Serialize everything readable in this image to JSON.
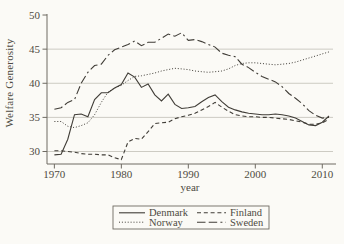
{
  "figure": {
    "background": "#fbfaf6",
    "line_color": "#403d37",
    "grid_color": "#c7c5bd",
    "axis_color": "#6e6a62",
    "text_color": "#4e4a42"
  },
  "chart_data": {
    "type": "line",
    "title": "",
    "ylabel": "Welfare Generosity",
    "xlabel": "year",
    "xlim": [
      1968.9,
      2011.6
    ],
    "ylim": [
      28.17,
      50.15
    ],
    "x_ticks": [
      1970,
      1980,
      1990,
      2000,
      2010
    ],
    "y_ticks": [
      30,
      35,
      40,
      45,
      50
    ],
    "grid_y": [
      30,
      35,
      40,
      45
    ],
    "grid": true,
    "legend_position": "bottom",
    "x": [
      1970,
      1971,
      1972,
      1973,
      1974,
      1975,
      1976,
      1977,
      1978,
      1979,
      1980,
      1981,
      1982,
      1983,
      1984,
      1985,
      1986,
      1987,
      1988,
      1989,
      1990,
      1991,
      1992,
      1993,
      1994,
      1995,
      1996,
      1997,
      1998,
      1999,
      2000,
      2001,
      2002,
      2003,
      2004,
      2005,
      2006,
      2007,
      2008,
      2009,
      2010,
      2011
    ],
    "series": [
      {
        "name": "Denmark",
        "line_style": "solid",
        "values": [
          29.5,
          29.6,
          31.8,
          35.4,
          35.5,
          35.1,
          37.6,
          38.6,
          38.6,
          39.3,
          39.8,
          41.5,
          40.9,
          39.4,
          39.9,
          38.3,
          37.4,
          38.4,
          36.9,
          36.3,
          36.4,
          36.6,
          37.3,
          37.9,
          38.3,
          37.3,
          36.5,
          36.1,
          35.8,
          35.6,
          35.5,
          35.4,
          35.4,
          35.5,
          35.4,
          35.2,
          34.9,
          34.4,
          33.9,
          33.8,
          34.3,
          35.2
        ]
      },
      {
        "name": "Finland",
        "line_style": "short-dash",
        "values": [
          30.1,
          30.1,
          30.0,
          29.9,
          29.7,
          29.6,
          29.6,
          29.5,
          29.5,
          29.1,
          28.8,
          31.4,
          31.9,
          31.8,
          32.9,
          34.1,
          34.2,
          34.3,
          34.8,
          35.1,
          35.3,
          35.6,
          36.1,
          36.6,
          37.2,
          36.5,
          35.9,
          35.4,
          35.2,
          35.1,
          35.1,
          35.0,
          35.0,
          34.9,
          34.8,
          34.7,
          34.5,
          34.3,
          34.0,
          34.0,
          34.2,
          34.7
        ]
      },
      {
        "name": "Norway",
        "line_style": "dot",
        "values": [
          34.4,
          34.4,
          33.7,
          33.5,
          33.8,
          34.2,
          35.4,
          37.2,
          38.7,
          39.3,
          39.7,
          40.4,
          41.0,
          41.1,
          41.3,
          41.5,
          41.8,
          42.0,
          42.2,
          42.1,
          42.0,
          41.8,
          41.7,
          41.6,
          41.7,
          41.8,
          42.1,
          42.6,
          42.9,
          43.0,
          43.0,
          42.9,
          42.8,
          42.7,
          42.8,
          42.9,
          43.1,
          43.4,
          43.7,
          44.0,
          44.3,
          44.6
        ]
      },
      {
        "name": "Sweden",
        "line_style": "long-dash-dot",
        "values": [
          36.2,
          36.4,
          37.2,
          37.6,
          40.0,
          41.6,
          42.6,
          42.8,
          44.1,
          44.9,
          45.3,
          45.7,
          46.2,
          45.5,
          46.0,
          46.0,
          46.6,
          47.2,
          46.9,
          47.4,
          46.3,
          46.4,
          46.1,
          45.7,
          45.3,
          44.4,
          44.1,
          43.9,
          42.8,
          42.3,
          41.6,
          41.0,
          40.6,
          40.2,
          39.5,
          38.5,
          37.8,
          37.0,
          36.0,
          35.3,
          34.9,
          35.0
        ]
      }
    ]
  }
}
